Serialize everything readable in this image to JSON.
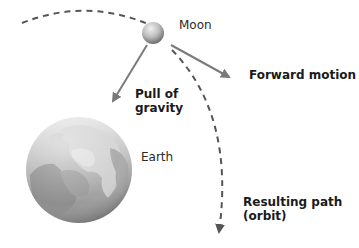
{
  "diagram": {
    "labels": {
      "moon": "Moon",
      "earth": "Earth",
      "gravity_line1": "Pull of",
      "gravity_line2": "gravity",
      "forward": "Forward motion",
      "path_line1": "Resulting path",
      "path_line2": "(orbit)"
    },
    "colors": {
      "arrow": "#7a7a7a",
      "dashed": "#555555",
      "text": "#1a1a1a",
      "background": "#ffffff"
    },
    "elements": [
      {
        "id": "moon",
        "shape": "sphere",
        "cx": 153,
        "cy": 33,
        "r": 11
      },
      {
        "id": "earth",
        "shape": "globe",
        "cx": 79,
        "cy": 170,
        "r": 53
      },
      {
        "id": "gravity-arrow",
        "from": [
          147,
          44
        ],
        "to": [
          111,
          104
        ]
      },
      {
        "id": "forward-arrow",
        "from": [
          170,
          55
        ],
        "to": [
          233,
          83
        ]
      },
      {
        "id": "orbit-path",
        "style": "dashed",
        "from": [
          22,
          22
        ],
        "to": [
          218,
          232
        ]
      }
    ]
  }
}
